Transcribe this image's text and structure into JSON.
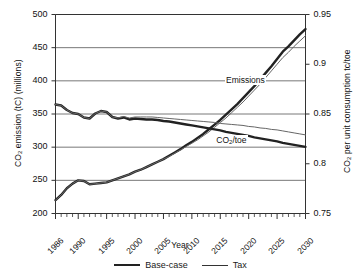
{
  "chart_data": {
    "type": "line",
    "title": "",
    "xlabel": "Year",
    "ylabel": "CO2 emission (tC) (millions)",
    "ylabel_right": "CO2 per unit consumption tc/toe",
    "xlim": [
      1986,
      2030
    ],
    "ylim": [
      200,
      500
    ],
    "ylim_right": [
      0.75,
      0.95
    ],
    "grid": true,
    "legend_position": "bottom-center",
    "y_ticks": [
      200,
      250,
      300,
      350,
      400,
      450,
      500
    ],
    "y_ticks_right": [
      "0.75",
      "0.8",
      "0.85",
      "0.9",
      "0.95"
    ],
    "x_ticks": [
      1986,
      1990,
      1995,
      2000,
      2005,
      2010,
      2015,
      2020,
      2025,
      2030
    ],
    "x_minor_tick_interval": 1,
    "annotations": [
      {
        "text": "Emissions",
        "x": 2019,
        "y": 400
      },
      {
        "text": "CO2/toe",
        "x": 2018,
        "y": 310
      }
    ],
    "legend": [
      {
        "name": "Base-case",
        "style": "thick",
        "color": "#222222"
      },
      {
        "name": "Tax",
        "style": "thin",
        "color": "#333333"
      }
    ],
    "x": [
      1986,
      1987,
      1988,
      1989,
      1990,
      1991,
      1992,
      1993,
      1994,
      1995,
      1996,
      1997,
      1998,
      1999,
      2000,
      2001,
      2002,
      2003,
      2004,
      2005,
      2006,
      2007,
      2008,
      2009,
      2010,
      2011,
      2012,
      2013,
      2014,
      2015,
      2016,
      2017,
      2018,
      2019,
      2020,
      2021,
      2022,
      2023,
      2024,
      2025,
      2026,
      2027,
      2028,
      2029,
      2030
    ],
    "series": [
      {
        "name": "Emissions Base-case",
        "axis": "left",
        "style": "thick",
        "values": [
          220,
          228,
          238,
          245,
          250,
          249,
          244,
          245,
          246,
          247,
          250,
          253,
          256,
          259,
          263,
          266,
          270,
          274,
          278,
          282,
          287,
          292,
          297,
          303,
          308,
          314,
          320,
          327,
          334,
          341,
          349,
          357,
          365,
          374,
          383,
          392,
          402,
          412,
          422,
          433,
          444,
          452,
          461,
          470,
          478
        ]
      },
      {
        "name": "Emissions Tax",
        "axis": "left",
        "style": "thin",
        "values": [
          220,
          228,
          238,
          245,
          250,
          249,
          244,
          245,
          246,
          247,
          250,
          253,
          256,
          259,
          263,
          266,
          270,
          274,
          278,
          282,
          286,
          291,
          296,
          301,
          306,
          311,
          317,
          323,
          330,
          337,
          344,
          352,
          360,
          368,
          377,
          386,
          395,
          405,
          415,
          425,
          435,
          443,
          452,
          460,
          468
        ]
      },
      {
        "name": "CO2/toe Base-case",
        "axis": "right",
        "style": "thick",
        "values": [
          0.8595,
          0.8585,
          0.854,
          0.851,
          0.85,
          0.8465,
          0.8455,
          0.8505,
          0.853,
          0.852,
          0.847,
          0.8455,
          0.8465,
          0.8445,
          0.8455,
          0.845,
          0.8445,
          0.8445,
          0.844,
          0.843,
          0.8425,
          0.8415,
          0.8405,
          0.8395,
          0.8385,
          0.8375,
          0.8365,
          0.8355,
          0.8345,
          0.8335,
          0.832,
          0.831,
          0.83,
          0.829,
          0.828,
          0.8265,
          0.8255,
          0.8245,
          0.8235,
          0.8225,
          0.821,
          0.82,
          0.819,
          0.818,
          0.817
        ]
      },
      {
        "name": "CO2/toe Tax",
        "axis": "right",
        "style": "thin",
        "values": [
          0.8595,
          0.8585,
          0.854,
          0.851,
          0.85,
          0.8465,
          0.8455,
          0.8505,
          0.853,
          0.852,
          0.847,
          0.846,
          0.8475,
          0.846,
          0.847,
          0.847,
          0.847,
          0.847,
          0.8465,
          0.846,
          0.8455,
          0.845,
          0.8445,
          0.844,
          0.8435,
          0.843,
          0.8425,
          0.842,
          0.8415,
          0.8405,
          0.84,
          0.8395,
          0.839,
          0.8385,
          0.8375,
          0.837,
          0.836,
          0.8355,
          0.8345,
          0.834,
          0.833,
          0.832,
          0.831,
          0.83,
          0.829
        ]
      }
    ]
  },
  "labels": {
    "ylabel_left_pre": "CO",
    "ylabel_left_sub": "2",
    "ylabel_left_post": " emission (tC) (millions)",
    "ylabel_right_pre": "CO",
    "ylabel_right_sub": "2",
    "ylabel_right_post": " per unit consumption tc/toe",
    "xlabel": "Year",
    "note_emissions": "Emissions",
    "note_toe_pre": "CO",
    "note_toe_sub": "2",
    "note_toe_post": "/toe",
    "legend_base": "Base-case",
    "legend_tax": "Tax"
  }
}
